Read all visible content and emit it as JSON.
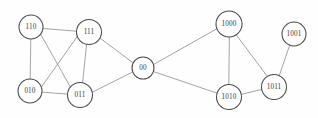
{
  "figure": {
    "background_color": "#fefefe",
    "node_fill_color": "#ffffff",
    "node_stroke_color": "#4a4a4a",
    "edge_color": "#8a8a8a",
    "label_color": "#3a3a3a",
    "width": 318,
    "height": 118
  },
  "graph": {
    "node_count": 9,
    "edge_count": 14,
    "nodes": [
      {
        "id": "110",
        "label": "110",
        "cx": 31,
        "cy": 27,
        "r": 12,
        "font_size": 7.2
      },
      {
        "id": "111",
        "label": "111",
        "cx": 89,
        "cy": 32,
        "r": 12.5,
        "font_size": 7.2
      },
      {
        "id": "010",
        "label": "010",
        "cx": 30,
        "cy": 91,
        "r": 12,
        "font_size": 7.2
      },
      {
        "id": "011",
        "label": "011",
        "cx": 80,
        "cy": 95,
        "r": 12.5,
        "font_size": 7.2
      },
      {
        "id": "00",
        "label": "00",
        "cx": 143,
        "cy": 68,
        "r": 11,
        "font_size": 7.2
      },
      {
        "id": "1000",
        "label": "1000",
        "cx": 229,
        "cy": 24,
        "r": 13,
        "font_size": 7.2
      },
      {
        "id": "1001",
        "label": "1001",
        "cx": 294,
        "cy": 34,
        "r": 12,
        "font_size": 7.2
      },
      {
        "id": "1010",
        "label": "1010",
        "cx": 229,
        "cy": 97,
        "r": 12.5,
        "font_size": 7.2
      },
      {
        "id": "1011",
        "label": "1011",
        "cx": 274,
        "cy": 87,
        "r": 12.5,
        "font_size": 7.2
      }
    ],
    "edges": [
      {
        "source": "110",
        "target": "111",
        "x1": 43,
        "y1": 28.5,
        "x2": 76.6,
        "y2": 31.2
      },
      {
        "source": "110",
        "target": "010",
        "x1": 30.8,
        "y1": 39,
        "x2": 30.2,
        "y2": 79
      },
      {
        "source": "110",
        "target": "011",
        "x1": 40.6,
        "y1": 34.1,
        "x2": 70.7,
        "y2": 87.6
      },
      {
        "source": "111",
        "target": "010",
        "x1": 77.4,
        "y1": 36.3,
        "x2": 41.5,
        "y2": 86.9
      },
      {
        "source": "111",
        "target": "011",
        "x1": 86.6,
        "y1": 44.4,
        "x2": 82.6,
        "y2": 82.6
      },
      {
        "source": "010",
        "target": "011",
        "x1": 42,
        "y1": 92.1,
        "x2": 67.5,
        "y2": 94.1
      },
      {
        "source": "111",
        "target": "00",
        "x1": 99.9,
        "y1": 38.1,
        "x2": 133.2,
        "y2": 62.9
      },
      {
        "source": "011",
        "target": "00",
        "x1": 92.3,
        "y1": 92.2,
        "x2": 132.5,
        "y2": 72.1
      },
      {
        "source": "00",
        "target": "1000",
        "x1": 153.5,
        "y1": 64.5,
        "x2": 218,
        "y2": 28.1
      },
      {
        "source": "00",
        "target": "1010",
        "x1": 153.9,
        "y1": 71.7,
        "x2": 217.2,
        "y2": 93.2
      },
      {
        "source": "1000",
        "target": "1010",
        "x1": 229.4,
        "y1": 37,
        "x2": 228.8,
        "y2": 84.5
      },
      {
        "source": "1000",
        "target": "1011",
        "x1": 236.3,
        "y1": 35,
        "x2": 267.5,
        "y2": 76.5
      },
      {
        "source": "1010",
        "target": "1011",
        "x1": 241.4,
        "y1": 94.4,
        "x2": 261.7,
        "y2": 89.4
      },
      {
        "source": "1011",
        "target": "1001",
        "x1": 279.3,
        "y1": 75.6,
        "x2": 289.6,
        "y2": 45.4
      }
    ]
  }
}
